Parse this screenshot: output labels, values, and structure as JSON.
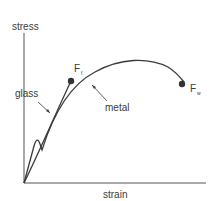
{
  "diagram": {
    "y_axis_label": "stress",
    "x_axis_label": "strain",
    "curves": [
      {
        "name": "glass",
        "label": "glass",
        "end_point": "F",
        "end_subscript": "f"
      },
      {
        "name": "metal",
        "label": "metal",
        "end_point": "F",
        "end_subscript": "w"
      }
    ],
    "colors": {
      "line": "#3a3a3a",
      "axis": "#555555",
      "point": "#333333",
      "background": "#ffffff"
    }
  }
}
